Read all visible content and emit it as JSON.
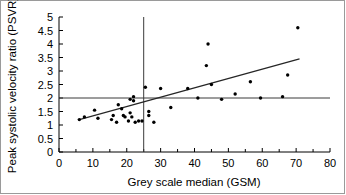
{
  "chart_data": {
    "type": "scatter",
    "title": "",
    "xlabel": "Grey scale median (GSM)",
    "ylabel": "Peak systolic velocity ratio (PSVR)",
    "xlim": [
      0,
      80
    ],
    "ylim": [
      0,
      5
    ],
    "grid": false,
    "legend": null,
    "xticks": [
      0,
      10,
      20,
      30,
      40,
      50,
      60,
      70,
      80
    ],
    "xtick_labels": [
      "0",
      "10",
      "20",
      "30",
      "40",
      "50",
      "60",
      "70",
      "80"
    ],
    "xminor_step": 5,
    "yticks": [
      0,
      0.5,
      1,
      1.5,
      2,
      2.5,
      3,
      3.5,
      4,
      4.5,
      5
    ],
    "ytick_labels": [
      "0",
      "0.5",
      "1",
      "1.5",
      "2",
      "2.5",
      "3",
      "3.5",
      "4",
      "4.5",
      "5"
    ],
    "points": [
      {
        "x": 6.0,
        "y": 1.2
      },
      {
        "x": 7.5,
        "y": 1.3
      },
      {
        "x": 10.5,
        "y": 1.55
      },
      {
        "x": 11.5,
        "y": 1.25
      },
      {
        "x": 15.5,
        "y": 1.2
      },
      {
        "x": 16.0,
        "y": 1.35
      },
      {
        "x": 17.0,
        "y": 1.1
      },
      {
        "x": 17.5,
        "y": 1.75
      },
      {
        "x": 18.5,
        "y": 1.6
      },
      {
        "x": 19.0,
        "y": 1.35
      },
      {
        "x": 19.5,
        "y": 1.3
      },
      {
        "x": 20.5,
        "y": 1.15
      },
      {
        "x": 21.0,
        "y": 1.95
      },
      {
        "x": 21.0,
        "y": 1.45
      },
      {
        "x": 21.5,
        "y": 1.3
      },
      {
        "x": 22.0,
        "y": 2.05
      },
      {
        "x": 22.0,
        "y": 1.9
      },
      {
        "x": 22.5,
        "y": 1.1
      },
      {
        "x": 23.5,
        "y": 1.15
      },
      {
        "x": 24.5,
        "y": 1.15
      },
      {
        "x": 25.5,
        "y": 2.4
      },
      {
        "x": 26.5,
        "y": 1.5
      },
      {
        "x": 26.5,
        "y": 1.35
      },
      {
        "x": 28.0,
        "y": 1.1
      },
      {
        "x": 30.0,
        "y": 2.35
      },
      {
        "x": 33.0,
        "y": 1.65
      },
      {
        "x": 38.0,
        "y": 2.35
      },
      {
        "x": 41.0,
        "y": 2.0
      },
      {
        "x": 43.5,
        "y": 3.2
      },
      {
        "x": 44.0,
        "y": 4.0
      },
      {
        "x": 45.0,
        "y": 2.5
      },
      {
        "x": 48.0,
        "y": 1.95
      },
      {
        "x": 52.0,
        "y": 2.15
      },
      {
        "x": 56.5,
        "y": 2.6
      },
      {
        "x": 59.5,
        "y": 2.0
      },
      {
        "x": 66.0,
        "y": 2.05
      },
      {
        "x": 67.5,
        "y": 2.85
      },
      {
        "x": 70.5,
        "y": 4.6
      }
    ],
    "fit_line": {
      "x0": 6.0,
      "y0": 1.2,
      "x1": 71.0,
      "y1": 3.45,
      "label": "regression line"
    },
    "reference_lines": [
      {
        "orientation": "horizontal",
        "value": 2.0,
        "axis": "y",
        "label": "PSVR threshold 2.0"
      },
      {
        "orientation": "vertical",
        "value": 25.0,
        "axis": "x",
        "label": "GSM threshold 25"
      }
    ],
    "colors": {
      "point": "#000000",
      "fit": "#262626",
      "reference": "#3a3a3a",
      "axis": "#000000",
      "background": "#ffffff"
    }
  }
}
